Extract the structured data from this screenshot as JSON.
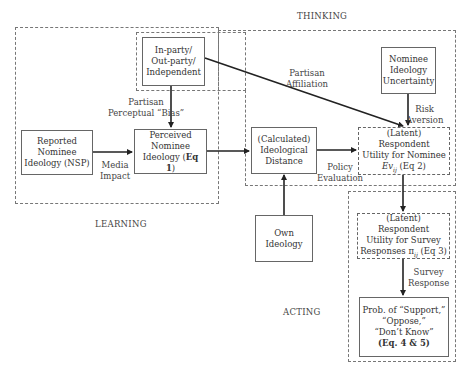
{
  "sections": {
    "thinking": "THINKING",
    "learning": "LEARNING",
    "acting": "ACTING"
  },
  "nodes": {
    "party": {
      "line1": "In-party/",
      "line2": "Out-party/",
      "line3": "Independent"
    },
    "uncertainty": {
      "line1": "Nominee",
      "line2": "Ideology",
      "line3": "Uncertainty"
    },
    "reported": {
      "line1": "Reported",
      "line2": "Nominee",
      "line3": "Ideology (NSP)"
    },
    "perceived": {
      "line1": "Perceived",
      "line2": "Nominee",
      "line3_prefix": "Ideology (",
      "line3_bold": "Eq 1",
      "line3_suffix": ")"
    },
    "distance": {
      "line1": "(Calculated)",
      "line2": "Ideological",
      "line3": "Distance"
    },
    "utility_nominee": {
      "line1": "(Latent) Respondent",
      "line2": "Utility for Nominee",
      "line3_italic": "Ev",
      "line3_sub": "ij",
      "line3_suffix": " (Eq 2)"
    },
    "own": {
      "line1": "Own",
      "line2": "Ideology"
    },
    "utility_survey": {
      "line1": "(Latent) Respondent",
      "line2": "Utility for Survey",
      "line3_prefix": "Responses π",
      "line3_sub": "ij",
      "line3_suffix": " (Eq 3)"
    },
    "prob": {
      "line1": "Prob. of “Support,”",
      "line2": "“Oppose,”",
      "line3": "“Don’t Know”",
      "line4_bold": "(Eq. 4 & 5)"
    }
  },
  "edges": {
    "partisan_bias": {
      "line1": "Partisan",
      "line2": "Perceptual “Bias”"
    },
    "partisan_affiliation": {
      "line1": "Partisan",
      "line2": "Affiliation"
    },
    "risk_aversion": {
      "line1": "Risk",
      "line2": "Aversion"
    },
    "media_impact": {
      "line1": "Media",
      "line2": "Impact"
    },
    "policy_evaluation": {
      "line1": "Policy",
      "line2": "Evaluation"
    },
    "survey_response": {
      "line1": "Survey",
      "line2": "Response"
    }
  }
}
